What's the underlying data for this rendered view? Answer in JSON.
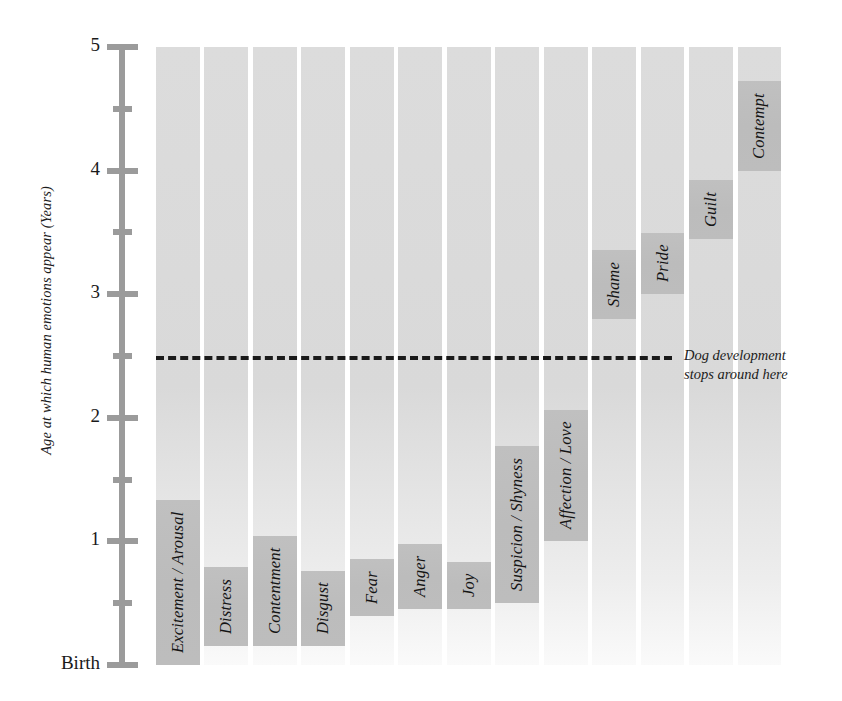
{
  "chart_data": {
    "type": "bar",
    "title": "",
    "xlabel": "",
    "ylabel": "Age at which human emotions appear (Years)",
    "ylim": [
      0,
      5
    ],
    "grid": false,
    "legend": "none",
    "y_tick_labels": [
      "5",
      "4.5",
      "4",
      "3.5",
      "3",
      "2.5",
      "2",
      "1.5",
      "1",
      "0.5",
      "Birth"
    ],
    "y_major_ticks": [
      {
        "value": 5,
        "label": "5"
      },
      {
        "value": 4,
        "label": "4"
      },
      {
        "value": 3,
        "label": "3"
      },
      {
        "value": 2,
        "label": "2"
      },
      {
        "value": 1,
        "label": "1"
      },
      {
        "value": 0,
        "label": "Birth"
      }
    ],
    "y_minor_ticks": [
      4.5,
      3.5,
      2.5,
      1.5,
      0.5
    ],
    "categories": [
      "Excitement / Arousal",
      "Distress",
      "Contentment",
      "Disgust",
      "Fear",
      "Anger",
      "Joy",
      "Suspicion / Shyness",
      "Affection / Love",
      "Shame",
      "Pride",
      "Guilt",
      "Contempt"
    ],
    "values": [
      0.0,
      0.15,
      0.15,
      0.15,
      0.4,
      0.45,
      0.45,
      0.5,
      1.0,
      2.8,
      3.0,
      3.45,
      4.0
    ],
    "bars": [
      {
        "label": "Excitement / Arousal",
        "onset_age": 0.0
      },
      {
        "label": "Distress",
        "onset_age": 0.15
      },
      {
        "label": "Contentment",
        "onset_age": 0.15
      },
      {
        "label": "Disgust",
        "onset_age": 0.15
      },
      {
        "label": "Fear",
        "onset_age": 0.4
      },
      {
        "label": "Anger",
        "onset_age": 0.45
      },
      {
        "label": "Joy",
        "onset_age": 0.45
      },
      {
        "label": "Suspicion / Shyness",
        "onset_age": 0.5
      },
      {
        "label": "Affection / Love",
        "onset_age": 1.0
      },
      {
        "label": "Shame",
        "onset_age": 2.8
      },
      {
        "label": "Pride",
        "onset_age": 3.0
      },
      {
        "label": "Guilt",
        "onset_age": 3.45
      },
      {
        "label": "Contempt",
        "onset_age": 4.0
      }
    ],
    "annotations": [
      {
        "name": "dog-development-line",
        "value": 2.5,
        "text": "Dog development\nstops around here",
        "style": "dashed"
      }
    ],
    "colors": {
      "bar_fill": "#d9d9d9",
      "label_box_fill": "#bcbcbc",
      "axis": "#9b9b9b",
      "text": "#1a1a1a",
      "annotation_line": "#1a1a1a",
      "background": "#ffffff"
    }
  }
}
